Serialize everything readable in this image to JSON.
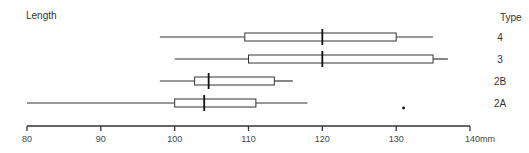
{
  "chart_data": {
    "type": "boxplot",
    "title": "",
    "ylabel": "Length",
    "category_axis_label": "Type",
    "xlabel": "",
    "x_unit": "mm",
    "xlim": [
      80,
      140
    ],
    "x_ticks": [
      80,
      90,
      100,
      110,
      120,
      130,
      140
    ],
    "x_tick_labels": [
      "80",
      "90",
      "100",
      "110",
      "120",
      "130",
      "140mm"
    ],
    "grid": false,
    "legend": null,
    "categories": [
      "4",
      "3",
      "2B",
      "2A"
    ],
    "series": [
      {
        "name": "4",
        "whisker_low": 98,
        "q1": 109.5,
        "median": 120,
        "q3": 130,
        "whisker_high": 135,
        "outliers": []
      },
      {
        "name": "3",
        "whisker_low": 100,
        "q1": 110,
        "median": 120,
        "q3": 135,
        "whisker_high": 137,
        "outliers": []
      },
      {
        "name": "2B",
        "whisker_low": 98,
        "q1": 102.7,
        "median": 104.6,
        "q3": 113.5,
        "whisker_high": 116,
        "outliers": []
      },
      {
        "name": "2A",
        "whisker_low": 80,
        "q1": 100,
        "median": 104,
        "q3": 111,
        "whisker_high": 118,
        "outliers": [
          131
        ]
      }
    ]
  },
  "labels": {
    "y_title": "Length",
    "type_title": "Type"
  },
  "style": {
    "line_color": "#333333",
    "box_fill": "#ffffff"
  }
}
